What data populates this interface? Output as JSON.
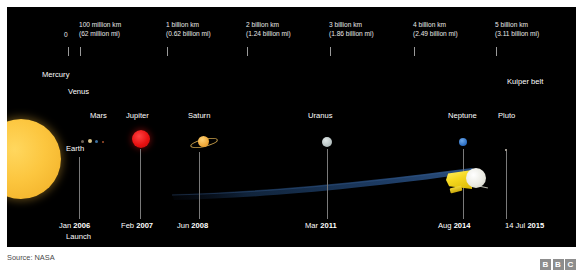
{
  "source_note": "Source: NASA",
  "brand": {
    "logo_letters": [
      "B",
      "B",
      "C"
    ]
  },
  "distance_scale": {
    "zero_label": "0",
    "ticks": [
      {
        "x": 68,
        "line1": "",
        "line2": ""
      },
      {
        "x": 80,
        "line1": "100 million km",
        "line2": "(62 million mi)"
      },
      {
        "x": 167,
        "line1": "1 billion km",
        "line2": "(0.62 billion mi)"
      },
      {
        "x": 247,
        "line1": "2 billion km",
        "line2": "(1.24 billion mi)"
      },
      {
        "x": 330,
        "line1": "3 billion km",
        "line2": "(1.86 billion mi)"
      },
      {
        "x": 414,
        "line1": "4 billion km",
        "line2": "(2.49 billion mi)"
      },
      {
        "x": 496,
        "line1": "5 billion km",
        "line2": "(3.11 billion mi)"
      }
    ]
  },
  "bodies": [
    {
      "name": "Mercury",
      "color": "#6e6356"
    },
    {
      "name": "Venus",
      "color": "#d8c48a"
    },
    {
      "name": "Earth",
      "color": "#3b6fa0"
    },
    {
      "name": "Mars",
      "color": "#a6512c"
    },
    {
      "name": "Jupiter",
      "color": "#e81111"
    },
    {
      "name": "Saturn",
      "color": "#f0a93a"
    },
    {
      "name": "Uranus",
      "color": "#b9c4c4"
    },
    {
      "name": "Neptune",
      "color": "#2d6fc4"
    },
    {
      "name": "Pluto",
      "color": "#cfc7bb"
    },
    {
      "name": "Kuiper belt",
      "color": "#ffffff"
    }
  ],
  "milestones": [
    {
      "month": "Jan ",
      "year": "2006",
      "note": "Launch"
    },
    {
      "month": "Feb ",
      "year": "2007",
      "note": ""
    },
    {
      "month": "Jun ",
      "year": "2008",
      "note": ""
    },
    {
      "month": "Mar ",
      "year": "2011",
      "note": ""
    },
    {
      "month": "Aug ",
      "year": "2014",
      "note": ""
    },
    {
      "month": "14 Jul ",
      "year": "2015",
      "note": ""
    }
  ],
  "colors": {
    "background": "#000000",
    "frame": "#ffffff",
    "text": "#ffffff",
    "scale_text": "#e8e8e8",
    "leader_line": "#7a7a7a",
    "trajectory": "#1b3560",
    "source_text": "#4a4a4a",
    "bbc_block": "#8d8d8d"
  }
}
